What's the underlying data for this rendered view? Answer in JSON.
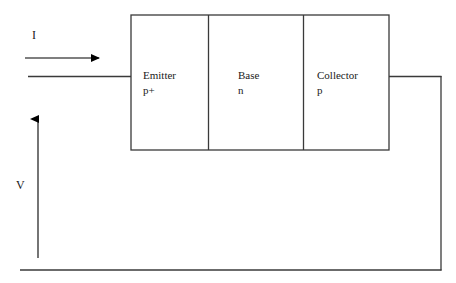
{
  "diagram": {
    "colors": {
      "stroke": "#3a3a3a",
      "arrow": "#000000",
      "text": "#1a1a1a",
      "background": "#ffffff"
    },
    "device": {
      "regions": [
        {
          "name": "emitter",
          "label": "Emitter",
          "doping": "p+"
        },
        {
          "name": "base",
          "label": "Base",
          "doping": "n"
        },
        {
          "name": "collector",
          "label": "Collector",
          "doping": "p"
        }
      ]
    },
    "annotations": [
      {
        "name": "current",
        "label": "I",
        "direction": "right"
      },
      {
        "name": "voltage",
        "label": "V",
        "direction": "up"
      }
    ]
  }
}
